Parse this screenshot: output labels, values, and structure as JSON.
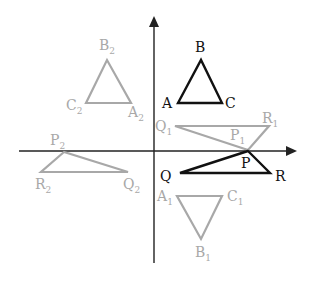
{
  "colors": {
    "axis": "#222222",
    "original": "#111111",
    "image": "#a8a8a8",
    "background": "#ffffff"
  },
  "axes": {
    "x": {
      "x1": 19,
      "y": 151,
      "x2": 297
    },
    "y": {
      "x": 154,
      "y1": 263,
      "y2": 16
    }
  },
  "triangles": [
    {
      "id": "ABC",
      "style": "original",
      "points": [
        [
          178,
          103
        ],
        [
          201,
          60
        ],
        [
          222,
          103
        ]
      ],
      "labels": [
        {
          "text": "A",
          "sub": "",
          "x": 162,
          "y": 108
        },
        {
          "text": "B",
          "sub": "",
          "x": 195,
          "y": 52
        },
        {
          "text": "C",
          "sub": "",
          "x": 225,
          "y": 108
        }
      ]
    },
    {
      "id": "A2B2C2",
      "style": "image",
      "points": [
        [
          86,
          103
        ],
        [
          107,
          60
        ],
        [
          131,
          103
        ]
      ],
      "labels": [
        {
          "text": "B",
          "sub": "2",
          "x": 99,
          "y": 50
        },
        {
          "text": "C",
          "sub": "2",
          "x": 66,
          "y": 110
        },
        {
          "text": "A",
          "sub": "2",
          "x": 128,
          "y": 117
        }
      ]
    },
    {
      "id": "P1Q1R1",
      "style": "image",
      "points": [
        [
          175,
          126
        ],
        [
          269,
          126
        ],
        [
          248,
          150
        ]
      ],
      "labels": [
        {
          "text": "Q",
          "sub": "1",
          "x": 155,
          "y": 131
        },
        {
          "text": "R",
          "sub": "1",
          "x": 262,
          "y": 123
        },
        {
          "text": "P",
          "sub": "1",
          "x": 230,
          "y": 140
        }
      ]
    },
    {
      "id": "PQR",
      "style": "original",
      "points": [
        [
          248,
          151
        ],
        [
          180,
          173
        ],
        [
          270,
          173
        ]
      ],
      "labels": [
        {
          "text": "P",
          "sub": "",
          "x": 241,
          "y": 168
        },
        {
          "text": "Q",
          "sub": "",
          "x": 160,
          "y": 181
        },
        {
          "text": "R",
          "sub": "",
          "x": 275,
          "y": 181
        }
      ]
    },
    {
      "id": "P2Q2R2",
      "style": "image",
      "points": [
        [
          64,
          152
        ],
        [
          41,
          172
        ],
        [
          128,
          172
        ]
      ],
      "labels": [
        {
          "text": "P",
          "sub": "2",
          "x": 50,
          "y": 145
        },
        {
          "text": "R",
          "sub": "2",
          "x": 35,
          "y": 189
        },
        {
          "text": "Q",
          "sub": "2",
          "x": 123,
          "y": 189
        }
      ]
    },
    {
      "id": "A1B1C1",
      "style": "image",
      "points": [
        [
          177,
          196
        ],
        [
          222,
          196
        ],
        [
          201,
          239
        ]
      ],
      "labels": [
        {
          "text": "A",
          "sub": "1",
          "x": 157,
          "y": 201
        },
        {
          "text": "C",
          "sub": "1",
          "x": 227,
          "y": 201
        },
        {
          "text": "B",
          "sub": "1",
          "x": 195,
          "y": 257
        }
      ]
    }
  ]
}
